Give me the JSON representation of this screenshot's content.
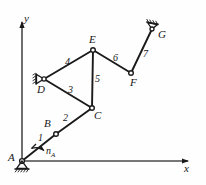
{
  "figure": {
    "type": "kinematic-linkage-diagram",
    "background_color": "#fefefe",
    "stroke_color": "#1a1a1a",
    "axes": {
      "x_label": "x",
      "y_label": "y",
      "origin_label": "A"
    },
    "joints": [
      {
        "id": "A",
        "label": "A",
        "x": 22,
        "y": 161,
        "kind": "fixed-pivot-ground",
        "label_dx": -12,
        "label_dy": -6
      },
      {
        "id": "B",
        "label": "B",
        "x": 56,
        "y": 134,
        "kind": "pin",
        "label_dx": -11,
        "label_dy": -14
      },
      {
        "id": "C",
        "label": "C",
        "x": 92,
        "y": 108,
        "kind": "pin",
        "label_dx": 2,
        "label_dy": 3
      },
      {
        "id": "D",
        "label": "D",
        "x": 44,
        "y": 79,
        "kind": "fixed-pivot",
        "label_dx": -6,
        "label_dy": 6
      },
      {
        "id": "E",
        "label": "E",
        "x": 93,
        "y": 50,
        "kind": "pin",
        "label_dx": -3,
        "label_dy": -15
      },
      {
        "id": "F",
        "label": "F",
        "x": 131,
        "y": 73,
        "kind": "pin",
        "label_dx": 0,
        "label_dy": 5
      },
      {
        "id": "G",
        "label": "G",
        "x": 152,
        "y": 29,
        "kind": "fixed-pivot",
        "label_dx": 5,
        "label_dy": 1
      }
    ],
    "links": [
      {
        "number": "1",
        "from": "A",
        "to": "B",
        "label_x": 40,
        "label_y": 138
      },
      {
        "number": "2",
        "from": "B",
        "to": "C",
        "label_x": 66,
        "label_y": 118
      },
      {
        "number": "3",
        "from": "D",
        "to": "C",
        "label_x": 71,
        "label_y": 90
      },
      {
        "number": "4",
        "from": "D",
        "to": "E",
        "label_x": 68,
        "label_y": 62
      },
      {
        "number": "5",
        "from": "E",
        "to": "C",
        "label_x": 96,
        "label_y": 79
      },
      {
        "number": "6",
        "from": "E",
        "to": "F",
        "label_x": 115,
        "label_y": 58
      },
      {
        "number": "7",
        "from": "F",
        "to": "G",
        "label_x": 145,
        "label_y": 54
      }
    ],
    "annotations": [
      {
        "id": "input-speed",
        "text": "n",
        "subscript": "A",
        "x": 48,
        "y": 151,
        "kind": "rotation-direction-arrow"
      }
    ]
  }
}
